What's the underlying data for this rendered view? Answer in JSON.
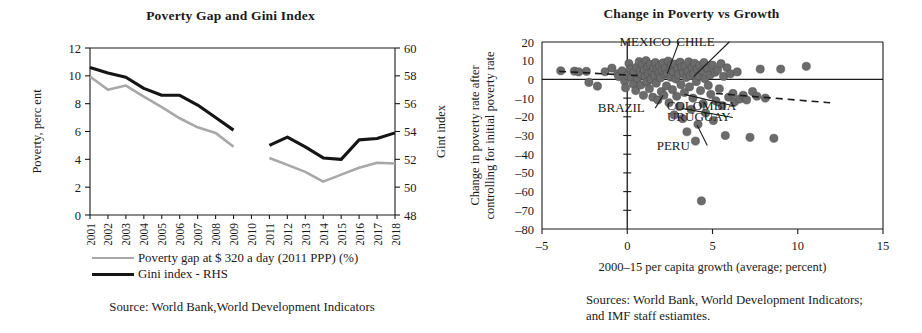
{
  "left": {
    "title": "Poverty Gap and Gini Index",
    "ylabel_left": "Poverty, perc ent",
    "ylabel_right": "Gint index",
    "legend": [
      {
        "name": "poverty-gap",
        "label": "Poverty gap at $ 320 a day (2011 PPP) (%)",
        "color": "#a8a8a8"
      },
      {
        "name": "gini-index",
        "label": "Gini index - RHS",
        "color": "#151515"
      }
    ],
    "source_lines": [
      "Source: World Bank,World Development Indicators"
    ]
  },
  "right": {
    "title": "Change in Poverty vs Growth",
    "ylabel_line1": "Change in poverty rate after",
    "ylabel_line2": "controlling for initial poverty rate",
    "xlabel": "2000–15 per capita growth (average; percent)",
    "source_lines": [
      "Sources: World Bank, World Development Indicators;",
      "and IMF staff estiamtes."
    ]
  },
  "chart_data": [
    {
      "type": "line",
      "title": "Poverty Gap and Gini Index",
      "xlabel": "",
      "ylabel": "Poverty, perc ent",
      "y2label": "Gint index",
      "grid": false,
      "legend_position": "below",
      "categories": [
        "2001",
        "2002",
        "2003",
        "2004",
        "2005",
        "2006",
        "2007",
        "2008",
        "2009",
        "2010",
        "2011",
        "2012",
        "2013",
        "2014",
        "2015",
        "2016",
        "2017",
        "2018"
      ],
      "ylim": [
        0,
        12
      ],
      "yticks": [
        0,
        2,
        4,
        6,
        8,
        10,
        12
      ],
      "y2lim": [
        48,
        60
      ],
      "y2ticks": [
        48,
        50,
        52,
        54,
        56,
        58,
        60
      ],
      "series": [
        {
          "name": "Poverty gap at $ 320 a day (2011 PPP) (%)",
          "axis": "left",
          "color": "#a8a8a8",
          "values": [
            9.95,
            9.0,
            9.3,
            8.5,
            7.75,
            6.95,
            6.3,
            5.9,
            4.9,
            null,
            4.1,
            3.6,
            3.1,
            2.4,
            2.9,
            3.4,
            3.75,
            3.7
          ]
        },
        {
          "name": "Gini index - RHS",
          "axis": "right",
          "color": "#151515",
          "values": [
            58.6,
            58.2,
            57.9,
            57.1,
            56.6,
            56.6,
            55.9,
            55.0,
            54.1,
            null,
            53.0,
            53.6,
            52.9,
            52.1,
            52.0,
            53.4,
            53.5,
            53.9
          ]
        }
      ]
    },
    {
      "type": "scatter",
      "title": "Change in Poverty vs Growth",
      "xlabel": "2000–15 per capita growth (average; percent)",
      "ylabel": "Change in poverty rate after controlling for initial poverty rate",
      "grid": false,
      "legend_position": "none",
      "xlim": [
        -5,
        15
      ],
      "xticks": [
        -5,
        0,
        5,
        10,
        15
      ],
      "ylim": [
        -80,
        20
      ],
      "yticks": [
        20,
        10,
        0,
        -10,
        -20,
        -30,
        -40,
        -50,
        -60,
        -70,
        -80
      ],
      "marker_color": "#6b6b6b",
      "zero_line_y": 0,
      "zero_line_x": 0,
      "trend_left": {
        "x": [
          -4.0,
          0.6
        ],
        "y": [
          4.3,
          2.0
        ],
        "style": "dashed"
      },
      "trend_right": {
        "x": [
          5.2,
          11.9
        ],
        "y": [
          -7.5,
          -12.5
        ],
        "style": "dashed"
      },
      "annotations": [
        {
          "label": "MEXICO",
          "text_x": 1.05,
          "text_y": 18.0,
          "point_x": 2.35,
          "point_y": 3.2
        },
        {
          "label": "CHILE",
          "text_x": 4.0,
          "text_y": 18.0,
          "point_x": 3.9,
          "point_y": 1.5
        },
        {
          "label": "BRAZIL",
          "text_x": -0.35,
          "text_y": -17.5,
          "point_x": 2.1,
          "point_y": -8.5
        },
        {
          "label": "COLOMBIA",
          "text_x": 4.35,
          "text_y": -16.5,
          "point_x": 3.35,
          "point_y": -8.0
        },
        {
          "label": "URUGUAY",
          "text_x": 4.2,
          "text_y": -22.5,
          "point_x": 3.2,
          "point_y": -15.5
        },
        {
          "label": "PERU",
          "text_x": 2.7,
          "text_y": -37.5,
          "point_x": 4.1,
          "point_y": -24.5
        }
      ],
      "points": [
        {
          "x": -3.9,
          "y": 4.6
        },
        {
          "x": -3.1,
          "y": 4.4
        },
        {
          "x": -2.85,
          "y": 4.0
        },
        {
          "x": -2.4,
          "y": 4.3
        },
        {
          "x": -2.25,
          "y": -1.6
        },
        {
          "x": -1.75,
          "y": -3.6
        },
        {
          "x": -1.3,
          "y": 4.1
        },
        {
          "x": -0.9,
          "y": 6.0
        },
        {
          "x": -0.55,
          "y": 3.0
        },
        {
          "x": -0.5,
          "y": 1.5
        },
        {
          "x": -0.3,
          "y": 4.6
        },
        {
          "x": -0.15,
          "y": -1.0
        },
        {
          "x": -0.1,
          "y": -4.5
        },
        {
          "x": 0.0,
          "y": 2.0
        },
        {
          "x": 0.1,
          "y": 8.5
        },
        {
          "x": 0.2,
          "y": 5.5
        },
        {
          "x": 0.25,
          "y": 1.0
        },
        {
          "x": 0.35,
          "y": -2.5
        },
        {
          "x": 0.4,
          "y": 3.8
        },
        {
          "x": 0.5,
          "y": -6.0
        },
        {
          "x": 0.55,
          "y": 6.5
        },
        {
          "x": 0.6,
          "y": 0.5
        },
        {
          "x": 0.7,
          "y": 9.5
        },
        {
          "x": 0.75,
          "y": 4.5
        },
        {
          "x": 0.8,
          "y": -3.0
        },
        {
          "x": 0.85,
          "y": 2.5
        },
        {
          "x": 0.9,
          "y": 7.5
        },
        {
          "x": 0.95,
          "y": -8.5
        },
        {
          "x": 1.0,
          "y": 5.0
        },
        {
          "x": 1.05,
          "y": 1.5
        },
        {
          "x": 1.1,
          "y": 10.0
        },
        {
          "x": 1.15,
          "y": -1.5
        },
        {
          "x": 1.2,
          "y": 6.8
        },
        {
          "x": 1.25,
          "y": 3.2
        },
        {
          "x": 1.3,
          "y": -5.0
        },
        {
          "x": 1.35,
          "y": 8.0
        },
        {
          "x": 1.4,
          "y": 0.0
        },
        {
          "x": 1.45,
          "y": 4.2
        },
        {
          "x": 1.5,
          "y": -9.5
        },
        {
          "x": 1.55,
          "y": 6.2
        },
        {
          "x": 1.6,
          "y": 2.2
        },
        {
          "x": 1.65,
          "y": 9.0
        },
        {
          "x": 1.7,
          "y": -2.0
        },
        {
          "x": 1.75,
          "y": 5.6
        },
        {
          "x": 1.8,
          "y": -11.0
        },
        {
          "x": 1.85,
          "y": 3.6
        },
        {
          "x": 1.9,
          "y": 7.2
        },
        {
          "x": 1.95,
          "y": 0.8
        },
        {
          "x": 2.0,
          "y": -6.5
        },
        {
          "x": 2.05,
          "y": 4.8
        },
        {
          "x": 2.1,
          "y": 8.8
        },
        {
          "x": 2.15,
          "y": -8.5
        },
        {
          "x": 2.2,
          "y": 2.8
        },
        {
          "x": 2.25,
          "y": 6.0
        },
        {
          "x": 2.3,
          "y": -3.5
        },
        {
          "x": 2.35,
          "y": 3.2
        },
        {
          "x": 2.4,
          "y": 9.8
        },
        {
          "x": 2.45,
          "y": -12.5
        },
        {
          "x": 2.5,
          "y": 5.2
        },
        {
          "x": 2.55,
          "y": 1.2
        },
        {
          "x": 2.6,
          "y": 7.8
        },
        {
          "x": 2.65,
          "y": -5.5
        },
        {
          "x": 2.7,
          "y": 4.0
        },
        {
          "x": 2.75,
          "y": -19.0
        },
        {
          "x": 2.8,
          "y": 8.2
        },
        {
          "x": 2.85,
          "y": 0.2
        },
        {
          "x": 2.9,
          "y": -9.0
        },
        {
          "x": 2.95,
          "y": 5.8
        },
        {
          "x": 3.0,
          "y": 2.6
        },
        {
          "x": 3.05,
          "y": -14.5
        },
        {
          "x": 3.1,
          "y": 9.2
        },
        {
          "x": 3.15,
          "y": -2.8
        },
        {
          "x": 3.2,
          "y": 6.6
        },
        {
          "x": 3.25,
          "y": -21.0
        },
        {
          "x": 3.3,
          "y": 3.4
        },
        {
          "x": 3.35,
          "y": -7.0
        },
        {
          "x": 3.4,
          "y": 7.0
        },
        {
          "x": 3.45,
          "y": 1.0
        },
        {
          "x": 3.5,
          "y": -28.0
        },
        {
          "x": 3.55,
          "y": 4.4
        },
        {
          "x": 3.6,
          "y": 9.4
        },
        {
          "x": 3.65,
          "y": -4.0
        },
        {
          "x": 3.7,
          "y": 2.0
        },
        {
          "x": 3.75,
          "y": -16.0
        },
        {
          "x": 3.8,
          "y": 6.4
        },
        {
          "x": 3.85,
          "y": -10.0
        },
        {
          "x": 3.9,
          "y": 3.0
        },
        {
          "x": 3.95,
          "y": 8.6
        },
        {
          "x": 4.0,
          "y": -33.0
        },
        {
          "x": 4.05,
          "y": -1.2
        },
        {
          "x": 4.1,
          "y": 5.4
        },
        {
          "x": 4.15,
          "y": -24.0
        },
        {
          "x": 4.2,
          "y": 1.8
        },
        {
          "x": 4.25,
          "y": 7.4
        },
        {
          "x": 4.3,
          "y": -6.0
        },
        {
          "x": 4.35,
          "y": -65.0
        },
        {
          "x": 4.4,
          "y": 4.6
        },
        {
          "x": 4.45,
          "y": -13.0
        },
        {
          "x": 4.5,
          "y": 9.0
        },
        {
          "x": 4.55,
          "y": 0.4
        },
        {
          "x": 4.6,
          "y": -18.0
        },
        {
          "x": 4.7,
          "y": 6.0
        },
        {
          "x": 4.75,
          "y": -3.2
        },
        {
          "x": 4.85,
          "y": 2.4
        },
        {
          "x": 4.9,
          "y": -8.0
        },
        {
          "x": 5.0,
          "y": 7.6
        },
        {
          "x": 5.05,
          "y": -22.0
        },
        {
          "x": 5.15,
          "y": 3.8
        },
        {
          "x": 5.2,
          "y": -11.5
        },
        {
          "x": 5.3,
          "y": 5.0
        },
        {
          "x": 5.4,
          "y": -5.0
        },
        {
          "x": 5.5,
          "y": 8.4
        },
        {
          "x": 5.55,
          "y": -14.0
        },
        {
          "x": 5.65,
          "y": 1.6
        },
        {
          "x": 5.75,
          "y": -30.0
        },
        {
          "x": 5.85,
          "y": 6.2
        },
        {
          "x": 5.95,
          "y": -9.5
        },
        {
          "x": 6.05,
          "y": 3.0
        },
        {
          "x": 6.2,
          "y": -7.5
        },
        {
          "x": 6.3,
          "y": -12.0
        },
        {
          "x": 6.45,
          "y": 4.0
        },
        {
          "x": 6.6,
          "y": -10.5
        },
        {
          "x": 6.8,
          "y": -8.5
        },
        {
          "x": 7.0,
          "y": -11.0
        },
        {
          "x": 7.2,
          "y": -31.0
        },
        {
          "x": 7.35,
          "y": -6.5
        },
        {
          "x": 7.6,
          "y": -9.0
        },
        {
          "x": 7.8,
          "y": 5.5
        },
        {
          "x": 8.1,
          "y": -10.0
        },
        {
          "x": 8.6,
          "y": -31.5
        },
        {
          "x": 9.0,
          "y": 5.5
        },
        {
          "x": 10.5,
          "y": 7.0
        }
      ]
    }
  ]
}
